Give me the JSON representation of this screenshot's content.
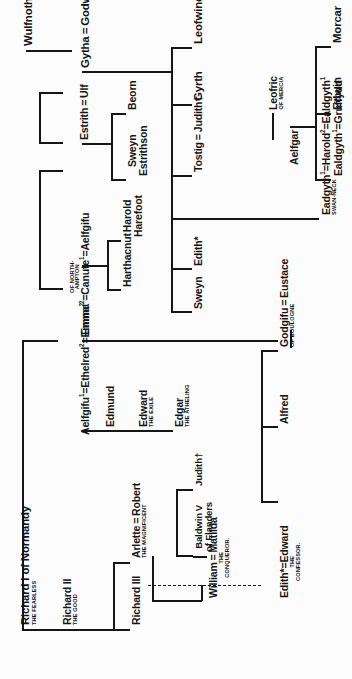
{
  "document": {
    "kind": "genealogical-tree",
    "title": "Anglo-Saxon and Norman royal genealogy",
    "orientation": "rotated-90-counterclockwise",
    "ink_color": "#161616",
    "paper_color": "#fcfcfc"
  },
  "people": {
    "wulfnoth": {
      "name": "Wulfnoth"
    },
    "gytha_godwin": {
      "name": "Gytha = Godwin"
    },
    "estrith_ulf": {
      "name": "Estrith = Ulf"
    },
    "beorn": {
      "name": "Beorn"
    },
    "sweyn_estrithson": {
      "name": "Sweyn",
      "line2": "Estrithson"
    },
    "emma_canute_aelfgifu": {
      "part1": "Emma",
      "sup1": "2",
      "part2": "=Canute",
      "sup2": "1",
      "part3": "=Aelfgifu",
      "sub": "OF NORTH-\nAMPTON"
    },
    "harthacnut": {
      "name": "Harthacnut"
    },
    "harold_harefoot": {
      "name": "Harold",
      "line2": "Harefoot"
    },
    "aelfgifu_ethelred_emma": {
      "part1": "Aelfgifu",
      "sup1": "1",
      "part2": "=Ethelred",
      "sup2": "2",
      "part3": "=Emma",
      "sup3": "2"
    },
    "edmund": {
      "name": "Edmund"
    },
    "edward_exile": {
      "name": "Edward",
      "sub": "THE EXILE"
    },
    "edgar_atheling": {
      "name": "Edgar",
      "sub": "THE ATHELING"
    },
    "richard_i": {
      "name": "Richard I of Normandy",
      "sub": "THE FEARLESS"
    },
    "richard_ii": {
      "name": "Richard II",
      "sub": "THE GOOD"
    },
    "richard_iii": {
      "name": "Richard III"
    },
    "arlette_robert": {
      "name": "Arlette = Robert",
      "sub": "THE MAGNIFICENT"
    },
    "baldwin_v": {
      "name": "Baldwin V",
      "line2": "of Flanders"
    },
    "judith": {
      "name": "Judith†"
    },
    "william_matilda": {
      "name": "William = Matilda",
      "sub": "THE\nCONQUEROR."
    },
    "edith_edward_confessor": {
      "name": "Edith*=Edward",
      "sub": "THE\nCONFESSOR."
    },
    "alfred": {
      "name": "Alfred"
    },
    "godgifu_eustace": {
      "name": "Godgifu = Eustace",
      "sub": "OF BOULOGNE"
    },
    "leofwine": {
      "name": "Leofwine"
    },
    "gyrth": {
      "name": "Gyrth"
    },
    "tostig_judith": {
      "name": "Tostig = Judith†"
    },
    "edith_star": {
      "name": "Edith*"
    },
    "sweyn": {
      "name": "Sweyn"
    },
    "leofric": {
      "name": "Leofric",
      "sub": "OF MERCIA"
    },
    "aelfgar": {
      "name": "Aelfgar"
    },
    "eadgyth_harold_ealdgyth": {
      "part1": "Eadgyth",
      "sup1": "1",
      "part2": "=Harold",
      "sup2": "2",
      "part3": "=Ealdgyth",
      "sup3": "1",
      "sub": "SWAN-NECK"
    },
    "ealdgyth_gruffydd": {
      "part1": "Ealdgyth",
      "sup1": "1",
      "part2": "=Gruffydd"
    },
    "edwin": {
      "name": "Edwin"
    },
    "morcar": {
      "name": "Morcar"
    }
  },
  "genealogy": {
    "generations": [
      {
        "label": "Wulfnoth line",
        "members": [
          "Wulfnoth",
          "Gytha = Godwin",
          "Estrith = Ulf"
        ]
      },
      {
        "label": "Godwin children",
        "members": [
          "Sweyn",
          "Edith*",
          "Tostig = Judith†",
          "Gyrth",
          "Leofwine",
          "Harold"
        ]
      },
      {
        "label": "Danish line",
        "members": [
          "Beorn",
          "Sweyn Estrithson",
          "Harthacnut",
          "Harold Harefoot"
        ]
      },
      {
        "label": "English royal line",
        "members": [
          "Aelfgifu ¹= Ethelred ²= Emma",
          "Edmund",
          "Edward the Exile",
          "Edgar the Atheling",
          "Edward the Confessor",
          "Alfred",
          "Godgifu"
        ]
      },
      {
        "label": "Norman line",
        "members": [
          "Richard I of Normandy",
          "Richard II",
          "Richard III",
          "Robert the Magnificent",
          "William the Conqueror"
        ]
      },
      {
        "label": "Mercian line",
        "members": [
          "Leofric of Mercia",
          "Aelfgar",
          "Ealdgyth ¹= Gruffydd",
          "Edwin",
          "Morcar"
        ]
      }
    ],
    "marriage_symbol": "=",
    "death_dagger": "†",
    "asterisk_note": "*",
    "dashed_link": "William the Conqueror — Edward the Confessor (claim link)"
  }
}
